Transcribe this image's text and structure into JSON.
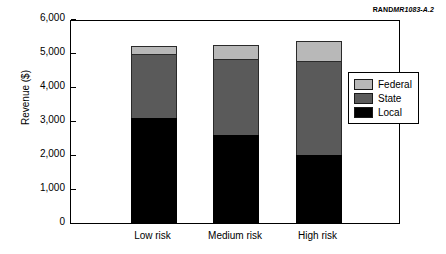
{
  "credit": {
    "rand_mark": "RAND",
    "doc_id": "MR1083-A.2"
  },
  "chart_data": {
    "type": "bar",
    "stacked": true,
    "title": "",
    "xlabel": "",
    "ylabel": "Revenue ($)",
    "categories": [
      "Low risk",
      "Medium risk",
      "High risk"
    ],
    "series": [
      {
        "name": "Local",
        "color": "#000000",
        "values": [
          3100,
          2600,
          2000
        ]
      },
      {
        "name": "State",
        "color": "#5a5a5a",
        "values": [
          1850,
          2200,
          2750
        ]
      },
      {
        "name": "Federal",
        "color": "#b8b8b8",
        "values": [
          250,
          450,
          600
        ]
      }
    ],
    "totals": [
      5200,
      5250,
      5350
    ],
    "ylim": [
      0,
      6000
    ],
    "ytick_values": [
      0,
      1000,
      2000,
      3000,
      4000,
      5000,
      6000
    ],
    "ytick_labels": [
      "0",
      "1,000",
      "2,000",
      "3,000",
      "4,000",
      "5,000",
      "6,000"
    ],
    "grid": false,
    "legend_position": "right",
    "legend_order": [
      "Federal",
      "State",
      "Local"
    ]
  },
  "legend": {
    "items": [
      {
        "label": "Federal",
        "color": "#b8b8b8"
      },
      {
        "label": "State",
        "color": "#5a5a5a"
      },
      {
        "label": "Local",
        "color": "#000000"
      }
    ]
  }
}
